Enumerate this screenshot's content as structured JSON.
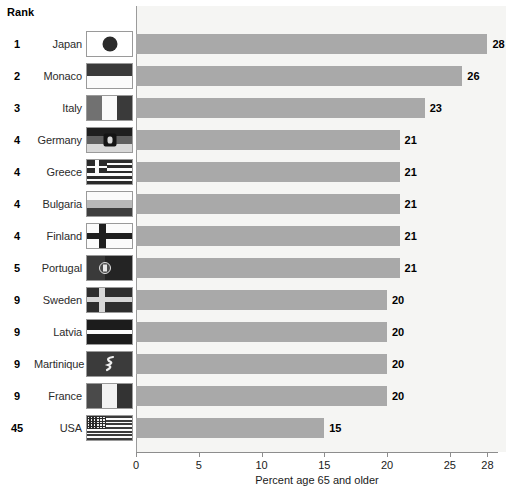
{
  "header": {
    "rank_label": "Rank"
  },
  "chart_data": {
    "type": "bar",
    "orientation": "horizontal",
    "title": "",
    "xlabel": "Percent age 65 and older",
    "ylabel": "",
    "xlim": [
      0,
      28
    ],
    "xticks": [
      0,
      5,
      10,
      15,
      20,
      25,
      28
    ],
    "xtick_labels": [
      "0",
      "5",
      "10",
      "15",
      "20",
      "25",
      "28"
    ],
    "grid": false,
    "legend": false,
    "bar_color": "#a9a9a9",
    "plot_background": "#f5f5f3",
    "categories": [
      "Japan",
      "Monaco",
      "Italy",
      "Germany",
      "Greece",
      "Bulgaria",
      "Finland",
      "Portugal",
      "Sweden",
      "Latvia",
      "Martinique",
      "France",
      "USA"
    ],
    "values": [
      28,
      26,
      23,
      21,
      21,
      21,
      21,
      21,
      20,
      20,
      20,
      20,
      15
    ],
    "value_labels": [
      "28",
      "26",
      "23",
      "21",
      "21",
      "21",
      "21",
      "21",
      "20",
      "20",
      "20",
      "20",
      "15"
    ],
    "ranks": [
      "1",
      "2",
      "3",
      "4",
      "4",
      "4",
      "4",
      "5",
      "9",
      "9",
      "9",
      "9",
      "45"
    ]
  },
  "rows": [
    {
      "rank": "1",
      "country": "Japan",
      "value": 28,
      "label": "28",
      "flag": "flag-japan"
    },
    {
      "rank": "2",
      "country": "Monaco",
      "value": 26,
      "label": "26",
      "flag": "flag-monaco"
    },
    {
      "rank": "3",
      "country": "Italy",
      "value": 23,
      "label": "23",
      "flag": "flag-italy"
    },
    {
      "rank": "4",
      "country": "Germany",
      "value": 21,
      "label": "21",
      "flag": "flag-germany"
    },
    {
      "rank": "4",
      "country": "Greece",
      "value": 21,
      "label": "21",
      "flag": "flag-greece"
    },
    {
      "rank": "4",
      "country": "Bulgaria",
      "value": 21,
      "label": "21",
      "flag": "flag-bulgaria"
    },
    {
      "rank": "4",
      "country": "Finland",
      "value": 21,
      "label": "21",
      "flag": "flag-finland"
    },
    {
      "rank": "5",
      "country": "Portugal",
      "value": 21,
      "label": "21",
      "flag": "flag-portugal"
    },
    {
      "rank": "9",
      "country": "Sweden",
      "value": 20,
      "label": "20",
      "flag": "flag-sweden"
    },
    {
      "rank": "9",
      "country": "Latvia",
      "value": 20,
      "label": "20",
      "flag": "flag-latvia"
    },
    {
      "rank": "9",
      "country": "Martinique",
      "value": 20,
      "label": "20",
      "flag": "flag-martinique"
    },
    {
      "rank": "9",
      "country": "France",
      "value": 20,
      "label": "20",
      "flag": "flag-france"
    },
    {
      "rank": "45",
      "country": "USA",
      "value": 15,
      "label": "15",
      "flag": "flag-usa"
    }
  ]
}
